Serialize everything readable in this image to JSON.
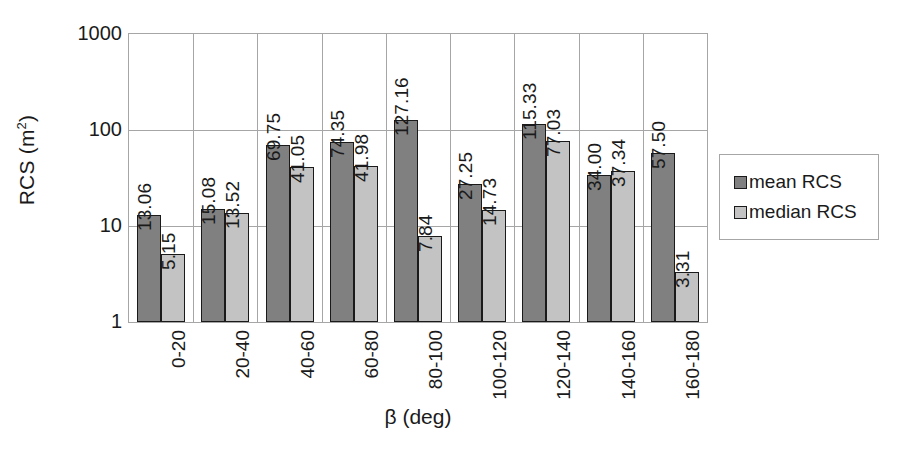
{
  "chart_data": {
    "type": "bar",
    "title": "",
    "xlabel": "β (deg)",
    "ylabel": "RCS (m²)",
    "ylabel_base": "RCS (m",
    "ylabel_sup": "2",
    "ylabel_close": ")",
    "yscale": "log",
    "ylim": [
      1,
      1000
    ],
    "ytick_labels": [
      "1000",
      "100",
      "10",
      "1"
    ],
    "ytick_values": [
      1000,
      100,
      10,
      1
    ],
    "grid": true,
    "legend_position": "right",
    "categories": [
      "0-20",
      "20-40",
      "40-60",
      "60-80",
      "80-100",
      "100-120",
      "120-140",
      "140-160",
      "160-180"
    ],
    "series": [
      {
        "name": "mean RCS",
        "color": "#808080",
        "values": [
          13.06,
          15.08,
          69.75,
          74.35,
          127.16,
          27.25,
          115.33,
          34.0,
          57.5
        ],
        "value_labels": [
          "13.06",
          "15.08",
          "69.75",
          "74.35",
          "127.16",
          "27.25",
          "115.33",
          "34.00",
          "57.50"
        ]
      },
      {
        "name": "median RCS",
        "color": "#c3c3c3",
        "values": [
          5.15,
          13.52,
          41.05,
          41.98,
          7.84,
          14.73,
          77.03,
          37.34,
          3.31
        ],
        "value_labels": [
          "5.15",
          "13.52",
          "41.05",
          "41.98",
          "7.84",
          "14.73",
          "77.03",
          "37.34",
          "3.31"
        ]
      }
    ]
  },
  "legend": {
    "items": [
      {
        "label": "mean RCS"
      },
      {
        "label": "median RCS"
      }
    ]
  }
}
